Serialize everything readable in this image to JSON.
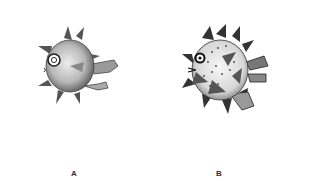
{
  "figure": {
    "panels": [
      {
        "label": "A",
        "subject": "pufferfish-illustration-smooth"
      },
      {
        "label": "B",
        "subject": "pufferfish-illustration-spiky"
      }
    ]
  },
  "colors": {
    "ink": "#2a2a2a",
    "shade": "#8a8a8a",
    "light": "#cfcfcf",
    "background": "#ffffff"
  }
}
